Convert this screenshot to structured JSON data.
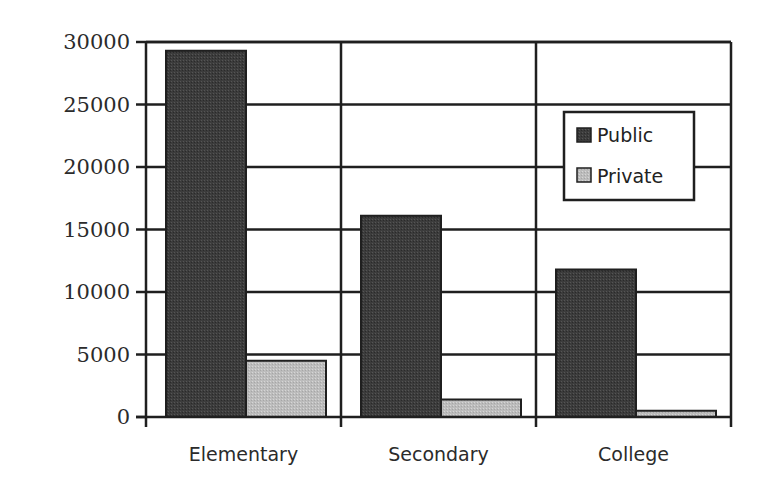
{
  "chart_data": {
    "type": "bar",
    "title": "",
    "xlabel": "",
    "ylabel": "",
    "categories": [
      "Elementary",
      "Secondary",
      "College"
    ],
    "series": [
      {
        "name": "Public",
        "values": [
          29300,
          16100,
          11800
        ],
        "color": "#3a3a3a"
      },
      {
        "name": "Private",
        "values": [
          4500,
          1400,
          500
        ],
        "color": "#bdbdbd"
      }
    ],
    "ylim": [
      0,
      30000
    ],
    "yticks": [
      0,
      5000,
      10000,
      15000,
      20000,
      25000,
      30000
    ],
    "ytick_labels": [
      "0",
      "5000",
      "10000",
      "15000",
      "20000",
      "25000",
      "30000"
    ],
    "grid": {
      "horizontal": true,
      "vertical_category_separators": true
    },
    "legend": {
      "position": "upper-right-inside",
      "entries": [
        "Public",
        "Private"
      ]
    }
  },
  "colors": {
    "axis": "#1f1f1f",
    "public": "#3a3a3a",
    "private": "#bdbdbd",
    "background": "#ffffff"
  }
}
